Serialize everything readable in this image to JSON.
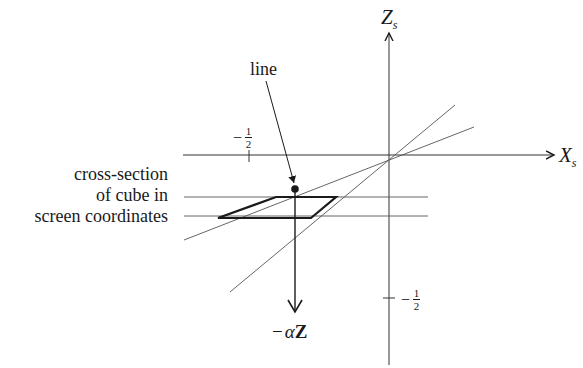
{
  "axes": {
    "z_axis": {
      "label": "Z",
      "subscript": "s"
    },
    "x_axis": {
      "label": "X",
      "subscript": "s"
    }
  },
  "ticks": {
    "x_neg_half": {
      "sign": "−",
      "num": "1",
      "den": "2"
    },
    "z_neg_half": {
      "sign": "−",
      "num": "1",
      "den": "2"
    }
  },
  "labels": {
    "line": "line",
    "cross_section": [
      "cross-section",
      "of cube in",
      "screen coordinates"
    ],
    "projection": {
      "prefix": "−",
      "alpha": "α",
      "vec": "Z"
    }
  },
  "colors": {
    "ink": "#1a1a1a",
    "thin": "#555555",
    "background": "#ffffff"
  }
}
